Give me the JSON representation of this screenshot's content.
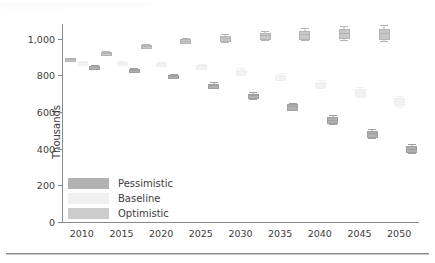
{
  "chart_data": {
    "type": "line",
    "title": "",
    "subtitle": "",
    "xlabel": "",
    "ylabel": "Thousands",
    "xlim": [
      2007.5,
      2052.5
    ],
    "ylim": [
      0,
      1080
    ],
    "grid": false,
    "legend_position": "inside-bottom-left",
    "marker_style": "box-and-whisker",
    "x_ticks": [
      2010,
      2015,
      2020,
      2025,
      2030,
      2035,
      2040,
      2045,
      2050
    ],
    "x_tick_labels": [
      "2010",
      "2015",
      "2020",
      "2025",
      "2030",
      "2035",
      "2040",
      "2045",
      "2050"
    ],
    "y_ticks": [
      0,
      200,
      400,
      600,
      800,
      1000
    ],
    "y_tick_labels": [
      "0",
      "200",
      "400",
      "600",
      "800",
      "1,000"
    ],
    "series": [
      {
        "name": "Optimistic",
        "color": "#b4b4b4",
        "box_fill": "#c8c8c8",
        "x": [
          2008.6,
          2013.1,
          2018.1,
          2023.1,
          2028.1,
          2033.1,
          2038.1,
          2043.1,
          2048.1
        ],
        "values": [
          888,
          922,
          960,
          990,
          1003,
          1018,
          1024,
          1031,
          1030
        ],
        "q1": [
          884,
          917,
          954,
          982,
          992,
          1004,
          1006,
          1010,
          1006
        ],
        "q3": [
          892,
          927,
          966,
          998,
          1014,
          1032,
          1042,
          1052,
          1054
        ],
        "low": [
          881,
          913,
          949,
          975,
          983,
          992,
          992,
          993,
          986
        ],
        "high": [
          895,
          931,
          971,
          1005,
          1023,
          1044,
          1056,
          1069,
          1074
        ]
      },
      {
        "name": "Baseline",
        "color": "#efefef",
        "box_fill": "#f2f2f2",
        "x": [
          2010.1,
          2015.1,
          2020.1,
          2025.1,
          2030.1,
          2035.1,
          2040.1,
          2045.1,
          2050.1
        ],
        "values": [
          870,
          868,
          863,
          849,
          821,
          793,
          753,
          710,
          659
        ],
        "q1": [
          866,
          863,
          857,
          842,
          812,
          782,
          740,
          695,
          642
        ],
        "q3": [
          874,
          873,
          869,
          856,
          830,
          804,
          766,
          725,
          676
        ],
        "low": [
          863,
          859,
          852,
          836,
          804,
          773,
          729,
          682,
          628
        ],
        "high": [
          877,
          877,
          874,
          862,
          838,
          813,
          777,
          738,
          690
        ]
      },
      {
        "name": "Pessimistic",
        "color": "#a0a0a0",
        "box_fill": "#b0b0b0",
        "x": [
          2011.6,
          2016.6,
          2021.6,
          2026.6,
          2031.6,
          2036.6,
          2041.6,
          2046.6,
          2051.6
        ],
        "values": [
          849,
          831,
          796,
          746,
          690,
          630,
          559,
          483,
          400
        ],
        "q1": [
          845,
          826,
          790,
          738,
          681,
          619,
          547,
          470,
          386
        ],
        "q3": [
          853,
          836,
          802,
          754,
          699,
          641,
          571,
          496,
          414
        ],
        "low": [
          842,
          822,
          785,
          731,
          673,
          610,
          537,
          459,
          374
        ],
        "high": [
          856,
          840,
          807,
          761,
          707,
          650,
          581,
          507,
          426
        ]
      }
    ],
    "legend": [
      {
        "label": "Pessimistic",
        "color": "#b2b2b2"
      },
      {
        "label": "Baseline",
        "color": "#f0f0f0"
      },
      {
        "label": "Optimistic",
        "color": "#cccccc"
      }
    ]
  }
}
